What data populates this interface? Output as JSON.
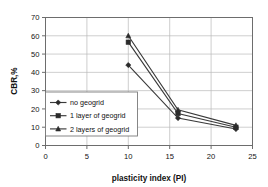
{
  "chart_data": {
    "type": "line",
    "title": "",
    "subtitle": "",
    "xlabel": "plasticity index  (PI)",
    "ylabel": "CBR,%",
    "xlim": [
      0,
      25
    ],
    "ylim": [
      0,
      70
    ],
    "xticks": [
      0,
      5,
      10,
      15,
      20,
      25
    ],
    "yticks": [
      0,
      10,
      20,
      30,
      40,
      50,
      60,
      70
    ],
    "xtick_labels": [
      "0",
      "5",
      "10",
      "15",
      "20",
      "25"
    ],
    "ytick_labels": [
      "0",
      "10",
      "20",
      "30",
      "40",
      "50",
      "60",
      "70"
    ],
    "grid": true,
    "grid_axis": "both",
    "legend_position": "center-left-inside",
    "x": [
      10,
      16,
      23
    ],
    "series": [
      {
        "name": "no geogrid",
        "marker": "diamond",
        "color": "#2b2b2b",
        "values": [
          44,
          15,
          9
        ]
      },
      {
        "name": "1 layer of geogrid",
        "marker": "square",
        "color": "#2b2b2b",
        "values": [
          56.5,
          17.5,
          10
        ]
      },
      {
        "name": "2 layers of geogrid",
        "marker": "triangle",
        "color": "#2b2b2b",
        "values": [
          60,
          19.5,
          11
        ]
      }
    ],
    "legend_entries": [
      "no geogrid",
      "1 layer of geogrid",
      "2 layers of geogrid"
    ]
  },
  "colors": {
    "background": "#ffffff",
    "frame": "#6d6d6d",
    "grid": "#b9b9b9",
    "series": "#2b2b2b",
    "text": "#111111"
  }
}
